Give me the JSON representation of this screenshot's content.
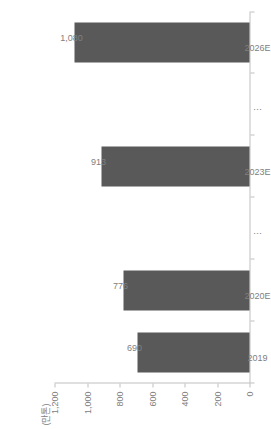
{
  "chart_data": {
    "type": "bar",
    "orientation": "vertical-drawn-rotated",
    "title": "",
    "subtitle": "",
    "xlabel": "",
    "ylabel": "",
    "unit_label": "(만톤)",
    "categories": [
      "2019",
      "2020E",
      "⋯",
      "2023E",
      "⋯",
      "2026E"
    ],
    "values": [
      690,
      776,
      null,
      913,
      null,
      1080
    ],
    "value_labels": [
      "690",
      "776",
      "",
      "913",
      "",
      "1,080"
    ],
    "ylim": [
      0,
      1200
    ],
    "yticks": [
      1200,
      1000,
      800,
      600,
      400,
      200,
      0
    ],
    "ytick_labels": [
      "1,200",
      "1,000",
      "800",
      "600",
      "400",
      "200",
      "0"
    ],
    "grid": false,
    "legend": null,
    "series": [
      {
        "name": "",
        "color": "#595959",
        "values": [
          690,
          776,
          null,
          913,
          null,
          1080
        ]
      }
    ],
    "colors": {
      "bar": "#595959",
      "axis": "#bfbfbf",
      "text": "#808080",
      "background": "#ffffff"
    }
  }
}
